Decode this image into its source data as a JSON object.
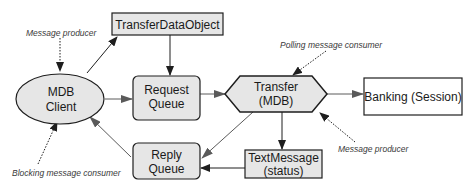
{
  "diagram": {
    "colors": {
      "fill": "#e6e6e6",
      "stroke": "#1e1e1e",
      "arrow_dark": "#1e1e1e",
      "arrow_gray": "#5a5a5a",
      "note_text": "#3a3a3a",
      "background": "#ffffff"
    },
    "nodes": {
      "mdb_client": {
        "line1": "MDB",
        "line2": "Client",
        "shape": "ellipse"
      },
      "transfer_data_object": {
        "label": "TransferDataObject",
        "shape": "rectangle"
      },
      "request_queue": {
        "line1": "Request",
        "line2": "Queue",
        "shape": "rounded-rectangle"
      },
      "transfer_mdb": {
        "line1": "Transfer",
        "line2": "(MDB)",
        "shape": "hexagon"
      },
      "banking_session": {
        "label": "Banking (Session)",
        "shape": "rectangle"
      },
      "reply_queue": {
        "line1": "Reply",
        "line2": "Queue",
        "shape": "rounded-rectangle"
      },
      "text_message": {
        "line1": "TextMessage",
        "line2": "(status)",
        "shape": "rectangle"
      }
    },
    "annotations": {
      "client_producer": "Message producer",
      "polling_consumer": "Polling message consumer",
      "mdb_producer": "Message producer",
      "blocking_consumer": "Blocking message consumer"
    },
    "edges": [
      {
        "from": "MDB Client",
        "to": "TransferDataObject"
      },
      {
        "from": "TransferDataObject",
        "to": "Request Queue"
      },
      {
        "from": "MDB Client",
        "to": "Request Queue"
      },
      {
        "from": "Request Queue",
        "to": "Transfer (MDB)"
      },
      {
        "from": "Transfer (MDB)",
        "to": "Banking (Session)"
      },
      {
        "from": "Transfer (MDB)",
        "to": "TextMessage (status)"
      },
      {
        "from": "Transfer (MDB)",
        "to": "Reply Queue"
      },
      {
        "from": "TextMessage (status)",
        "to": "Reply Queue"
      },
      {
        "from": "Reply Queue",
        "to": "MDB Client"
      }
    ]
  }
}
